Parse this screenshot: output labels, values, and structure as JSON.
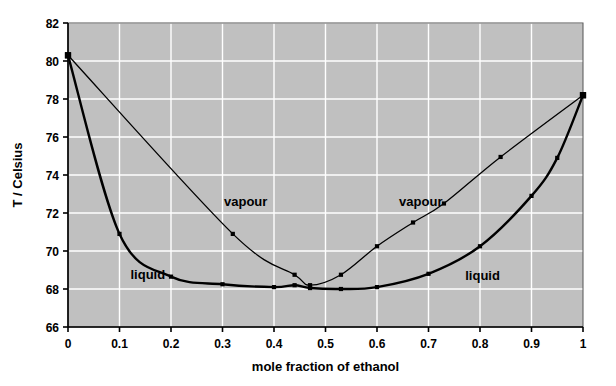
{
  "chart_data": {
    "type": "line",
    "title": "",
    "xlabel": "mole fraction of ethanol",
    "ylabel": "T / Celsius",
    "xlim": [
      0,
      1
    ],
    "ylim": [
      66,
      82
    ],
    "xticks": [
      "0",
      "0.1",
      "0.2",
      "0.3",
      "0.4",
      "0.5",
      "0.6",
      "0.7",
      "0.8",
      "0.9",
      "1"
    ],
    "xtick_values": [
      0,
      0.1,
      0.2,
      0.3,
      0.4,
      0.5,
      0.6,
      0.7,
      0.8,
      0.9,
      1
    ],
    "yticks": [
      "66",
      "68",
      "70",
      "72",
      "74",
      "76",
      "78",
      "80",
      "82"
    ],
    "ytick_values": [
      66,
      68,
      70,
      72,
      74,
      76,
      78,
      80,
      82
    ],
    "grid": true,
    "grid_color": "#ffffff",
    "plot_background": "#c0c0c0",
    "legend": "inline-annotations",
    "series": [
      {
        "name": "liquid",
        "color": "#000000",
        "line_width": 2.4,
        "marker": "square",
        "x": [
          0,
          0.1,
          0.2,
          0.3,
          0.4,
          0.44,
          0.47,
          0.53,
          0.6,
          0.7,
          0.8,
          0.9,
          0.95,
          1
        ],
        "values": [
          80.3,
          70.9,
          68.65,
          68.25,
          68.1,
          68.2,
          68.05,
          68.0,
          68.1,
          68.8,
          70.25,
          72.9,
          74.9,
          78.2
        ]
      },
      {
        "name": "vapour",
        "color": "#000000",
        "line_width": 1.3,
        "marker": "square",
        "x": [
          0,
          0.32,
          0.44,
          0.47,
          0.53,
          0.6,
          0.67,
          0.73,
          0.84,
          1
        ],
        "values": [
          80.3,
          70.9,
          68.75,
          68.2,
          68.75,
          70.25,
          71.5,
          72.5,
          74.95,
          78.2
        ]
      }
    ],
    "annotations": [
      {
        "text": "vapour",
        "x": 0.345,
        "y": 72.35,
        "name": "vapour-label-left"
      },
      {
        "text": "vapour",
        "x": 0.685,
        "y": 72.35,
        "name": "vapour-label-right"
      },
      {
        "text": "liquid",
        "x": 0.155,
        "y": 68.55,
        "name": "liquid-label-left"
      },
      {
        "text": "liquid",
        "x": 0.805,
        "y": 68.5,
        "name": "liquid-label-right"
      }
    ]
  }
}
